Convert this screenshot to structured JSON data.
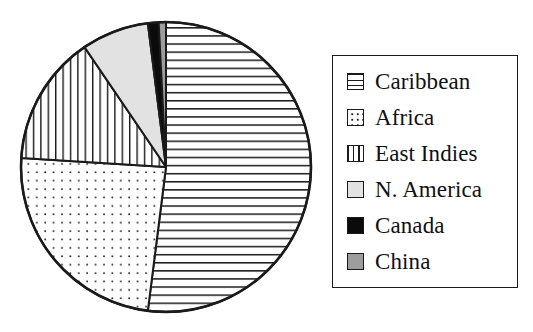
{
  "chart_data": {
    "type": "pie",
    "title": "",
    "subtitle": "",
    "xlabel": "",
    "ylabel": "",
    "legend_position": "right",
    "grid": false,
    "categories": [
      "Caribbean",
      "Africa",
      "East Indies",
      "N. America",
      "Canada",
      "China"
    ],
    "values": [
      52,
      24,
      14.5,
      7.5,
      1.2,
      0.8
    ],
    "units": "percent",
    "slices": [
      {
        "label": "Caribbean",
        "value": 52,
        "start_angle": 0,
        "end_angle": 187.2,
        "fill": "horizontal-lines",
        "color": "#ffffff"
      },
      {
        "label": "Africa",
        "value": 24,
        "start_angle": 187.2,
        "end_angle": 273.6,
        "fill": "dots",
        "color": "#ffffff"
      },
      {
        "label": "East Indies",
        "value": 14.5,
        "start_angle": 273.6,
        "end_angle": 325.8,
        "fill": "vertical-lines",
        "color": "#ffffff"
      },
      {
        "label": "N. America",
        "value": 7.5,
        "start_angle": 325.8,
        "end_angle": 352.8,
        "fill": "solid",
        "color": "#e2e2e2"
      },
      {
        "label": "Canada",
        "value": 1.2,
        "start_angle": 352.8,
        "end_angle": 357.1,
        "fill": "solid",
        "color": "#0b0b0b"
      },
      {
        "label": "China",
        "value": 0.8,
        "start_angle": 357.1,
        "end_angle": 360,
        "fill": "solid",
        "color": "#9d9d9d"
      }
    ]
  },
  "legend": {
    "items": [
      {
        "label": "Caribbean",
        "swatch": "hlines-swatch-icon"
      },
      {
        "label": "Africa",
        "swatch": "dots-swatch-icon"
      },
      {
        "label": "East Indies",
        "swatch": "vlines-swatch-icon"
      },
      {
        "label": "N. America",
        "swatch": "light-gray-swatch-icon"
      },
      {
        "label": "Canada",
        "swatch": "black-swatch-icon"
      },
      {
        "label": "China",
        "swatch": "gray-swatch-icon"
      }
    ]
  },
  "colors": {
    "outline": "#1a1a1a",
    "background": "#ffffff",
    "light_gray": "#e2e2e2",
    "mid_gray": "#9d9d9d",
    "black": "#0b0b0b"
  }
}
